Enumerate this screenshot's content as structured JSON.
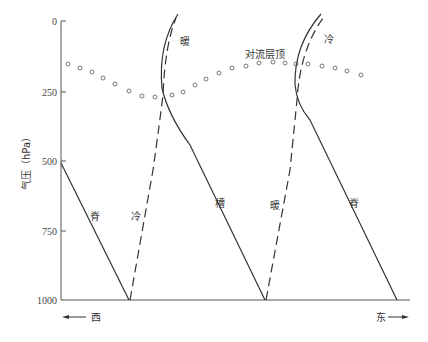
{
  "header": {
    "partial_text": "..."
  },
  "axis": {
    "y_label": "气压（hPa）",
    "y_ticks": [
      "0",
      "250",
      "500",
      "750",
      "1000"
    ]
  },
  "direction": {
    "west": "西",
    "east": "东"
  },
  "labels": {
    "tropopause": "对流层顶",
    "warm_top": "暖",
    "cold_top": "冷",
    "ridge_left": "脊",
    "cold_bottom": "冷",
    "trough": "槽",
    "warm_bottom": "暖",
    "ridge_right": "脊"
  },
  "colors": {
    "line": "#333333",
    "dots": "#666666",
    "background": "#ffffff"
  }
}
